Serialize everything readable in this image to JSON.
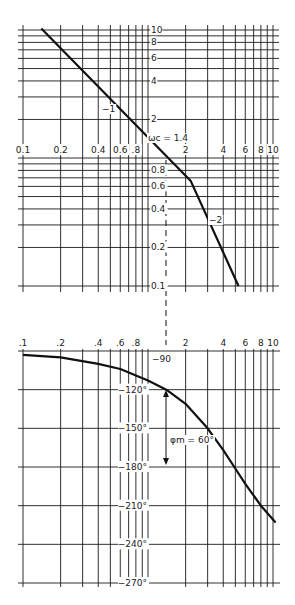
{
  "chart_data": [
    {
      "type": "line",
      "title": "Magnitude (asymptotic Bode plot)",
      "xscale": "log",
      "yscale": "log",
      "xlim": [
        0.1,
        10
      ],
      "ylim": [
        0.1,
        10
      ],
      "x_tick_labels": [
        "0.1",
        "0.2",
        "0.4",
        "0.6",
        ".8",
        "2",
        "4",
        "6",
        "8",
        "10"
      ],
      "x_tick_values": [
        0.1,
        0.2,
        0.4,
        0.6,
        0.8,
        2,
        4,
        6,
        8,
        10
      ],
      "y_tick_labels": [
        "10",
        "8",
        "6",
        "4",
        "2",
        "0.8",
        "0.6",
        "0.4",
        "0.2",
        "0.1"
      ],
      "y_tick_values": [
        10,
        8,
        6,
        4,
        2,
        0.8,
        0.6,
        0.4,
        0.2,
        0.1
      ],
      "grid": true,
      "series": [
        {
          "name": "|G(jw)| asymptote",
          "x": [
            0.14,
            2.2,
            5.3
          ],
          "y": [
            10.3,
            0.66,
            0.1
          ]
        }
      ],
      "annotations": [
        {
          "text": "−1",
          "x": 0.5,
          "y": 3.6,
          "meaning": "slope -1"
        },
        {
          "text": "−2",
          "x": 3.3,
          "y": 0.35,
          "meaning": "slope -2"
        },
        {
          "text": "ωc = 1.4",
          "x": 1.05,
          "y": 1.45,
          "meaning": "crossover frequency"
        }
      ]
    },
    {
      "type": "line",
      "title": "Phase",
      "xscale": "log",
      "xlim": [
        0.1,
        10
      ],
      "ylim": [
        -270,
        -90
      ],
      "x_tick_labels": [
        ".1",
        ".2",
        ".4",
        ".6",
        ".8",
        "2",
        "4",
        "6",
        "8",
        "10"
      ],
      "x_tick_values": [
        0.1,
        0.2,
        0.4,
        0.6,
        0.8,
        2,
        4,
        6,
        8,
        10
      ],
      "y_tick_labels": [
        "−90",
        "−120°",
        "−150°",
        "−180°",
        "−210°",
        "−240°",
        "−270°"
      ],
      "y_tick_values": [
        -90,
        -120,
        -150,
        -180,
        -210,
        -240,
        -270
      ],
      "grid": true,
      "series": [
        {
          "name": "phase",
          "x": [
            0.1,
            0.2,
            0.4,
            0.6,
            0.8,
            1.0,
            1.4,
            2.0,
            3.0,
            4.0,
            4.9,
            6.0,
            8.0,
            10.5
          ],
          "y": [
            -93,
            -95,
            -100,
            -104,
            -109,
            -113,
            -120,
            -131,
            -150,
            -167,
            -180,
            -193,
            -210,
            -223
          ]
        }
      ],
      "annotations": [
        {
          "text": "φm = 60°",
          "x": 1.4,
          "y": -150,
          "meaning": "phase margin between -120 and -180 at crossover"
        }
      ]
    }
  ],
  "labels": {
    "wc": "ωc = 1.4",
    "slope1": "−1",
    "slope2": "−2",
    "phase_margin": "φm = 60°"
  }
}
